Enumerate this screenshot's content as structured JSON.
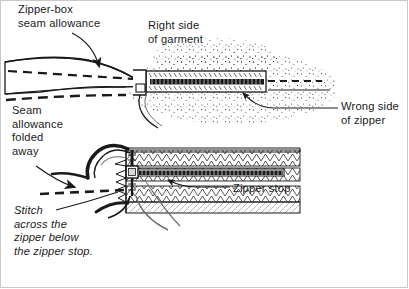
{
  "figure": {
    "background_color": "#ffffff",
    "border_color": "#c9c9c9",
    "ink_color": "#1a1a1a",
    "width": 409,
    "height": 289
  },
  "labels": {
    "zipper_box": "Zipper-box\nseam allowance",
    "right_side_garment": "Right side\nof garment",
    "wrong_side_zipper": "Wrong side\nof zipper",
    "seam_allowance_folded": "Seam\nallowance\nfolded\naway",
    "zipper_stop": "Zipper stop",
    "stitch_instruction": "Stitch\nacross the\nzipper below\nthe zipper stop."
  },
  "diagram": {
    "views": [
      {
        "name": "upper-view",
        "description": "Garment edge folded back over zipper tape, seen from above"
      },
      {
        "name": "lower-view",
        "description": "Zipper end with stop, seam allowance folded away, stitching line"
      }
    ],
    "leaders": [
      {
        "name": "leader-zipper-box",
        "from_label": "zipper_box",
        "style": "curved-arrow"
      },
      {
        "name": "leader-wrong-side",
        "from_label": "wrong_side_zipper",
        "style": "straight-with-arrow"
      },
      {
        "name": "leader-zipper-stop",
        "from_label": "zipper_stop",
        "style": "straight-with-arrow"
      },
      {
        "name": "leader-stitch",
        "from_label": "stitch_instruction",
        "style": "straight"
      },
      {
        "name": "leader-fold-arrow",
        "from_label": "seam_allowance_folded",
        "style": "curved-arrow"
      }
    ]
  }
}
